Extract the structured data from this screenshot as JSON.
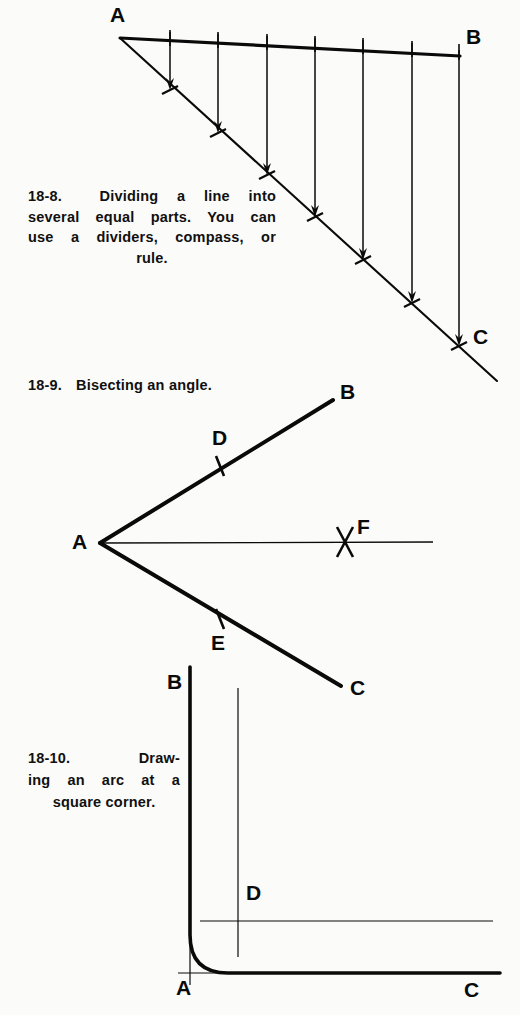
{
  "page": {
    "background_color": "#fbfbf9",
    "ink_color": "#0a0a0a",
    "width": 520,
    "height": 1015
  },
  "figures": [
    {
      "id": "fig-18-8",
      "number": "18-8.",
      "caption_lines": [
        "Dividing a line into",
        "several equal parts. You can",
        "use a dividers, compass, or",
        "rule."
      ],
      "caption_full": "18-8. Dividing a line into several equal parts. You can use a dividers, compass, or rule.",
      "point_labels": [
        "A",
        "B",
        "C"
      ],
      "labels": {
        "A": "A",
        "B": "B",
        "C": "C"
      },
      "divisions": 7,
      "description": "Triangle with horizontal-ish top line A to B, diagonal line A to C, and six vertical projection lines with arrowheads and tick marks dividing both lines into equal parts."
    },
    {
      "id": "fig-18-9",
      "number": "18-9.",
      "caption_lines": [
        "Bisecting an angle."
      ],
      "caption_full": "18-9. Bisecting an angle.",
      "point_labels": [
        "A",
        "B",
        "C",
        "D",
        "E",
        "F"
      ],
      "labels": {
        "A": "A",
        "B": "B",
        "C": "C",
        "D": "D",
        "E": "E",
        "F": "F"
      },
      "description": "Angle with vertex A, rays A-B upward and A-C downward, tick marks D and E on the rays, thin bisector ray through cross mark F."
    },
    {
      "id": "fig-18-10",
      "number": "18-10.",
      "caption_lines": [
        "Draw-",
        "ing an arc at a",
        "square corner."
      ],
      "caption_full": "18-10. Drawing an arc at a square corner.",
      "point_labels": [
        "A",
        "B",
        "C",
        "D"
      ],
      "labels": {
        "A": "A",
        "B": "B",
        "C": "C",
        "D": "D"
      },
      "description": "Square corner at A with vertical leg to B and horizontal leg to C, a fillet arc joining them, plus thin construction lines meeting at center D."
    }
  ]
}
